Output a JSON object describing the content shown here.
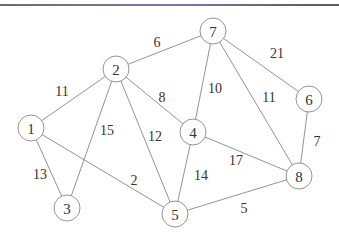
{
  "diagram": {
    "type": "weighted-undirected-graph",
    "nodes": [
      {
        "id": "1",
        "label": "1",
        "x": 31,
        "y": 128
      },
      {
        "id": "2",
        "label": "2",
        "x": 116,
        "y": 69
      },
      {
        "id": "3",
        "label": "3",
        "x": 67,
        "y": 208
      },
      {
        "id": "4",
        "label": "4",
        "x": 193,
        "y": 132
      },
      {
        "id": "5",
        "label": "5",
        "x": 175,
        "y": 214
      },
      {
        "id": "6",
        "label": "6",
        "x": 309,
        "y": 99
      },
      {
        "id": "7",
        "label": "7",
        "x": 213,
        "y": 31
      },
      {
        "id": "8",
        "label": "8",
        "x": 299,
        "y": 176
      }
    ],
    "edges": [
      {
        "from": "2",
        "to": "7",
        "weight": "6",
        "lx": 157,
        "ly": 42,
        "color": "#333"
      },
      {
        "from": "7",
        "to": "6",
        "weight": "21",
        "lx": 277,
        "ly": 53,
        "color": "#333"
      },
      {
        "from": "1",
        "to": "2",
        "weight": "11",
        "lx": 62,
        "ly": 91,
        "color": "#333"
      },
      {
        "from": "2",
        "to": "4",
        "weight": "8",
        "lx": 162,
        "ly": 97,
        "color": "#333"
      },
      {
        "from": "7",
        "to": "4",
        "weight": "10",
        "lx": 215,
        "ly": 88,
        "color": "#333"
      },
      {
        "from": "7",
        "to": "8",
        "weight": "11",
        "lx": 269,
        "ly": 97,
        "color": "#333"
      },
      {
        "from": "2",
        "to": "3",
        "weight": "15",
        "lx": 107,
        "ly": 130,
        "color": "#333"
      },
      {
        "from": "2",
        "to": "5",
        "weight": "12",
        "lx": 155,
        "ly": 136,
        "color": "#333"
      },
      {
        "from": "6",
        "to": "8",
        "weight": "7",
        "lx": 317,
        "ly": 141,
        "color": "#3a8a3a"
      },
      {
        "from": "1",
        "to": "3",
        "weight": "13",
        "lx": 40,
        "ly": 174,
        "color": "#333"
      },
      {
        "from": "1",
        "to": "5",
        "weight": "2",
        "lx": 134,
        "ly": 180,
        "color": "#333"
      },
      {
        "from": "4",
        "to": "8",
        "weight": "17",
        "lx": 236,
        "ly": 160,
        "color": "#333"
      },
      {
        "from": "4",
        "to": "5",
        "weight": "14",
        "lx": 201,
        "ly": 175,
        "color": "#333"
      },
      {
        "from": "5",
        "to": "8",
        "weight": "5",
        "lx": 244,
        "ly": 208,
        "color": "#333"
      }
    ],
    "node_radius": 13
  }
}
